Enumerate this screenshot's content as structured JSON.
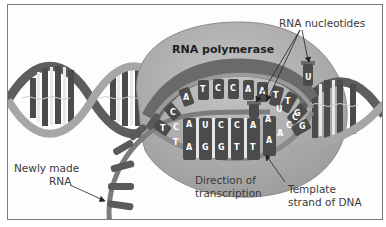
{
  "diagram": {
    "labels": {
      "polymerase": "RNA polymerase",
      "nucleotides": "RNA nucleotides",
      "newly_made_rna_line1": "Newly made",
      "newly_made_rna_line2": "RNA",
      "direction_line1": "Direction of",
      "direction_line2": "transcription",
      "template_line1": "Template",
      "template_line2": "strand of DNA"
    },
    "sequences": {
      "coding_strand": [
        "T",
        "C",
        "A",
        "T",
        "C",
        "C",
        "A",
        "A",
        "T",
        "T",
        "G",
        "G"
      ],
      "rna_strand": [
        "C",
        "A",
        "U",
        "C",
        "C",
        "A",
        "A",
        "U"
      ],
      "template_strand": [
        "T",
        "A",
        "G",
        "G",
        "T",
        "T",
        "A",
        "A",
        "C",
        "C"
      ],
      "free_nucleotides": [
        "U",
        "U"
      ]
    },
    "colors": {
      "dna_strand": "#9a9a9a",
      "dna_backbone_dark": "#5e5e5e",
      "base_dark": "#4b4b4b",
      "polymerase_fill": "#a8a8a8",
      "polymerase_edge": "#8a8a8a",
      "frame": "#7a7a7a",
      "arrow": "#222222"
    }
  }
}
